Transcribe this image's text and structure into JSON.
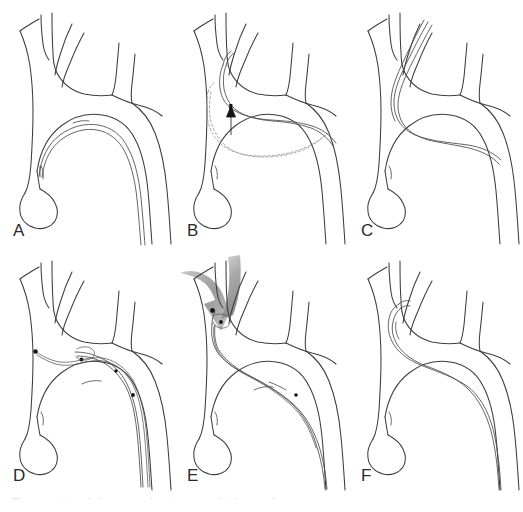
{
  "figure": {
    "panel_count": 6,
    "columns": 3,
    "rows": 2,
    "background_color": "#ffffff",
    "line_color": "#3c3c3c",
    "accent_gray": "#999999",
    "caption_partial": "Figure continues below — caption text cropped at image edge"
  },
  "panels": [
    {
      "id": "panel-a",
      "label": "A",
      "description": "Catheter advanced retrograde along the inner curvature of the aortic arch",
      "has_arrow": false,
      "has_ghost_path": false,
      "has_wire": false,
      "markers": 1
    },
    {
      "id": "panel-b",
      "label": "B",
      "description": "Catheter withdrawn and rotated; dashed outline shows the previous position, solid arrow shows direction of advancement",
      "has_arrow": true,
      "arrow_type": "solid-up",
      "has_ghost_path": true,
      "has_wire": false,
      "markers": 2
    },
    {
      "id": "panel-c",
      "label": "C",
      "description": "Catheter tip engaged and advanced into the left common carotid artery",
      "has_arrow": false,
      "has_ghost_path": false,
      "has_wire": false,
      "markers": 1
    },
    {
      "id": "panel-d",
      "label": "D",
      "description": "Guidewire advanced through the catheter across the arch with radiopaque markers visible",
      "has_arrow": false,
      "has_ghost_path": false,
      "has_wire": true,
      "markers": 4
    },
    {
      "id": "panel-e",
      "label": "E",
      "description": "Shaded arrow indicates downward force applied at the branch origin to seat the system",
      "has_arrow": true,
      "arrow_type": "shaded-curved-down",
      "has_ghost_path": false,
      "has_wire": true,
      "markers": 3
    },
    {
      "id": "panel-f",
      "label": "F",
      "description": "Final catheter position hooked within the innominate artery",
      "has_arrow": false,
      "has_ghost_path": false,
      "has_wire": false,
      "markers": 1
    }
  ]
}
